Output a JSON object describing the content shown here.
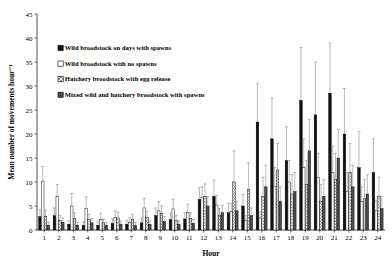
{
  "chart_data": {
    "type": "bar",
    "title": "",
    "subtitle": "",
    "xlabel": "Hour",
    "ylabel": "Mean number of movements hour⁻¹",
    "ylim": [
      0,
      45
    ],
    "ytick_step": 5,
    "yticks": [
      0,
      5,
      10,
      15,
      20,
      25,
      30,
      35,
      40,
      45
    ],
    "grid": false,
    "legend_position": "upper-left-inside",
    "categories": [
      "1",
      "2",
      "3",
      "4",
      "5",
      "6",
      "7",
      "8",
      "9",
      "10",
      "11",
      "12",
      "13",
      "14",
      "15",
      "16",
      "17",
      "18",
      "19",
      "20",
      "21",
      "22",
      "23",
      "24"
    ],
    "series": [
      {
        "name": "Wild broodstock on days with spawns",
        "fill": "solid-black",
        "color": "#111111",
        "values": [
          2.8,
          3.0,
          1.2,
          1.0,
          1.0,
          1.4,
          1.2,
          1.5,
          3.0,
          2.2,
          2.3,
          6.4,
          7.0,
          3.6,
          5.0,
          22.5,
          19.0,
          14.5,
          27.0,
          24.0,
          28.5,
          20.0,
          13.0,
          12.0
        ],
        "errors": [
          1.4,
          1.6,
          0.8,
          0.7,
          0.7,
          0.9,
          0.8,
          1.0,
          1.6,
          1.3,
          1.3,
          2.4,
          3.4,
          2.0,
          2.4,
          8.0,
          8.5,
          7.0,
          11.0,
          11.0,
          10.5,
          9.5,
          7.5,
          7.0
        ]
      },
      {
        "name": "Wild broodstock with no spawns",
        "fill": "open-white",
        "color": "#ffffff",
        "values": [
          10.2,
          7.0,
          5.0,
          4.5,
          2.2,
          2.6,
          1.6,
          4.6,
          4.0,
          4.4,
          3.6,
          6.8,
          5.2,
          3.8,
          2.0,
          2.5,
          9.0,
          10.0,
          13.0,
          11.0,
          12.0,
          8.0,
          6.0,
          4.0
        ],
        "errors": [
          3.0,
          2.5,
          2.6,
          2.4,
          1.3,
          1.4,
          1.0,
          2.0,
          1.9,
          2.0,
          1.8,
          2.2,
          2.0,
          1.7,
          1.0,
          1.3,
          4.0,
          4.5,
          6.0,
          5.0,
          5.5,
          4.0,
          3.0,
          2.2
        ]
      },
      {
        "name": "Hatchery broodstock with egg release",
        "fill": "hatched-gray",
        "color": "#9a9a9a",
        "values": [
          2.8,
          2.0,
          2.4,
          2.2,
          1.5,
          2.5,
          2.2,
          2.6,
          3.4,
          2.0,
          2.4,
          7.0,
          3.0,
          10.0,
          8.5,
          7.0,
          12.5,
          7.5,
          9.5,
          6.0,
          10.5,
          12.0,
          6.5,
          7.0
        ],
        "errors": [
          1.3,
          1.0,
          1.2,
          1.1,
          0.8,
          1.2,
          1.1,
          1.3,
          1.6,
          1.0,
          1.2,
          2.6,
          1.5,
          6.5,
          5.5,
          4.0,
          5.5,
          4.0,
          5.0,
          3.5,
          5.5,
          6.0,
          4.0,
          4.0
        ]
      },
      {
        "name": "Mixed wild and hatchery broodstock with spawns",
        "fill": "solid-darkgray",
        "color": "#4d4d4d",
        "values": [
          1.0,
          1.6,
          1.0,
          1.5,
          1.0,
          1.2,
          1.0,
          1.2,
          1.8,
          1.2,
          1.4,
          5.0,
          3.6,
          4.0,
          3.0,
          9.0,
          6.0,
          8.0,
          16.5,
          7.0,
          15.0,
          9.0,
          7.5,
          4.5
        ],
        "errors": [
          0.6,
          0.9,
          0.6,
          0.9,
          0.6,
          0.7,
          0.6,
          0.7,
          1.0,
          0.7,
          0.8,
          2.0,
          1.6,
          2.0,
          1.6,
          4.5,
          3.0,
          4.0,
          6.5,
          3.5,
          6.0,
          4.5,
          4.0,
          2.5
        ]
      }
    ]
  },
  "legend": {
    "items": [
      {
        "label": "Wild broodstock on days with spawns",
        "marker": "solid-black-square"
      },
      {
        "label": "Wild broodstock with no spawns",
        "marker": "open-white-square"
      },
      {
        "label": "Hatchery broodstock with egg release",
        "marker": "hatched-gray-square"
      },
      {
        "label": "Mixed wild and hatchery broodstock with spawns",
        "marker": "solid-darkgray-square"
      }
    ]
  }
}
